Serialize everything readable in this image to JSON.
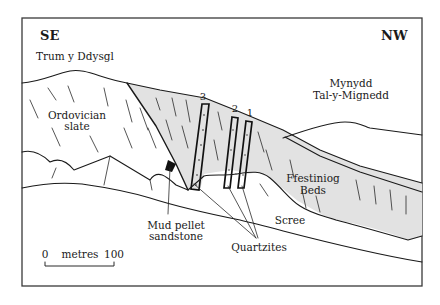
{
  "diagram": {
    "colors": {
      "frame": "#3a3a3a",
      "line": "#1a1a1a",
      "ffestiniog_fill": "#e2e2e2",
      "quartzite_fill": "#ffffff",
      "mud_pellet_fill": "#111111",
      "background": "#ffffff"
    },
    "directions": {
      "left": "SE",
      "right": "NW"
    },
    "peaks": {
      "left": "Trum y Ddysgl",
      "right_line1": "Mynydd",
      "right_line2": "Tal-y-Mignedd"
    },
    "units": {
      "slate_line1": "Ordovician",
      "slate_line2": "slate",
      "ffestiniog_line1": "Ffestiniog",
      "ffestiniog_line2": "Beds",
      "scree": "Scree",
      "mud_pellet_line1": "Mud pellet",
      "mud_pellet_line2": "sandstone",
      "quartzites": "Quartzites"
    },
    "quartzite_numbers": [
      "3",
      "2",
      "1"
    ],
    "scale_bar": {
      "start": "0",
      "unit": "metres",
      "end": "100"
    }
  }
}
